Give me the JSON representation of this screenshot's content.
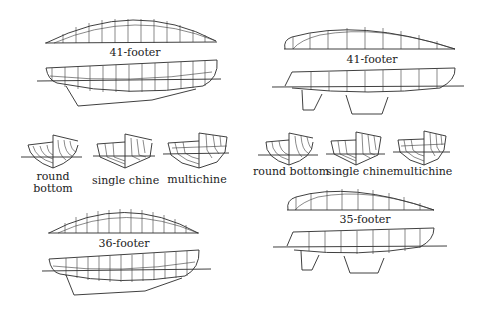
{
  "diagram": {
    "left_column": {
      "top_boat": {
        "label": "41-footer"
      },
      "sections": [
        {
          "label_line1": "round",
          "label_line2": "bottom"
        },
        {
          "label_line1": "single chine",
          "label_line2": ""
        },
        {
          "label_line1": "multichine",
          "label_line2": ""
        }
      ],
      "bottom_boat": {
        "label": "36-footer"
      }
    },
    "right_column": {
      "top_boat": {
        "label": "41-footer"
      },
      "sections": [
        {
          "label_line1": "round bottom"
        },
        {
          "label_line1": "single chine"
        },
        {
          "label_line1": "multichine"
        }
      ],
      "bottom_boat": {
        "label": "35-footer"
      }
    }
  }
}
